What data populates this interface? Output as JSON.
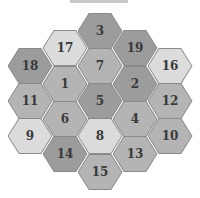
{
  "diagram": {
    "title": "",
    "colors": {
      "dark": "#9c9c9c",
      "medium": "#b4b4b4",
      "light": "#dcdcdc",
      "border": "#8a8a8a",
      "text": "#3a3a3a"
    },
    "hexes": [
      {
        "id": "3",
        "x": 100,
        "y": 31,
        "shade": "dark"
      },
      {
        "id": "17",
        "x": 65,
        "y": 48,
        "shade": "light"
      },
      {
        "id": "19",
        "x": 135,
        "y": 48,
        "shade": "dark"
      },
      {
        "id": "18",
        "x": 30,
        "y": 66,
        "shade": "dark"
      },
      {
        "id": "7",
        "x": 100,
        "y": 66,
        "shade": "medium"
      },
      {
        "id": "16",
        "x": 170,
        "y": 66,
        "shade": "light"
      },
      {
        "id": "1",
        "x": 65,
        "y": 84,
        "shade": "medium"
      },
      {
        "id": "2",
        "x": 135,
        "y": 84,
        "shade": "dark"
      },
      {
        "id": "11",
        "x": 30,
        "y": 101,
        "shade": "medium"
      },
      {
        "id": "5",
        "x": 100,
        "y": 101,
        "shade": "dark"
      },
      {
        "id": "12",
        "x": 170,
        "y": 101,
        "shade": "medium"
      },
      {
        "id": "6",
        "x": 65,
        "y": 119,
        "shade": "medium"
      },
      {
        "id": "4",
        "x": 135,
        "y": 119,
        "shade": "medium"
      },
      {
        "id": "9",
        "x": 30,
        "y": 136,
        "shade": "light"
      },
      {
        "id": "8",
        "x": 100,
        "y": 136,
        "shade": "light"
      },
      {
        "id": "10",
        "x": 170,
        "y": 136,
        "shade": "medium"
      },
      {
        "id": "14",
        "x": 65,
        "y": 154,
        "shade": "dark"
      },
      {
        "id": "13",
        "x": 135,
        "y": 154,
        "shade": "medium"
      },
      {
        "id": "15",
        "x": 100,
        "y": 172,
        "shade": "medium"
      }
    ]
  }
}
